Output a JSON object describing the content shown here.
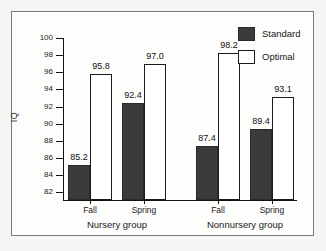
{
  "chart_data": {
    "type": "bar",
    "title": "",
    "xlabel": "",
    "ylabel": "IQ",
    "ylim": [
      81.1,
      100
    ],
    "yticks": [
      82,
      84,
      86,
      88,
      90,
      92,
      94,
      96,
      98,
      100
    ],
    "grid": false,
    "legend_position": "top-right",
    "categories": [
      "Fall",
      "Spring",
      "Fall",
      "Spring"
    ],
    "groups": [
      {
        "name": "Nursery group",
        "categories": [
          "Fall",
          "Spring"
        ]
      },
      {
        "name": "Nonnursery group",
        "categories": [
          "Fall",
          "Spring"
        ]
      }
    ],
    "series": [
      {
        "name": "Standard",
        "color": "#3b3b3b",
        "values": [
          85.2,
          92.4,
          87.4,
          89.4
        ]
      },
      {
        "name": "Optimal",
        "color": "#ffffff",
        "values": [
          95.8,
          97.0,
          98.2,
          93.1
        ]
      }
    ],
    "bars": [
      {
        "label": "85.2",
        "series": "Standard",
        "group": "Nursery group",
        "category": "Fall",
        "value": 85.2,
        "left": 68,
        "width": 22
      },
      {
        "label": "95.8",
        "series": "Optimal",
        "group": "Nursery group",
        "category": "Fall",
        "value": 95.8,
        "left": 90,
        "width": 22
      },
      {
        "label": "92.4",
        "series": "Standard",
        "group": "Nursery group",
        "category": "Spring",
        "value": 92.4,
        "left": 122,
        "width": 22
      },
      {
        "label": "97.0",
        "series": "Optimal",
        "group": "Nursery group",
        "category": "Spring",
        "value": 97.0,
        "left": 144,
        "width": 22
      },
      {
        "label": "87.4",
        "series": "Standard",
        "group": "Nonnursery group",
        "category": "Fall",
        "value": 87.4,
        "left": 196,
        "width": 22
      },
      {
        "label": "98.2",
        "series": "Optimal",
        "group": "Nonnursery group",
        "category": "Fall",
        "value": 98.2,
        "left": 218,
        "width": 22
      },
      {
        "label": "89.4",
        "series": "Standard",
        "group": "Nonnursery group",
        "category": "Spring",
        "value": 89.4,
        "left": 250,
        "width": 22
      },
      {
        "label": "93.1",
        "series": "Optimal",
        "group": "Nonnursery group",
        "category": "Spring",
        "value": 93.1,
        "left": 272,
        "width": 22
      }
    ]
  },
  "axis": {
    "ylabel": "IQ",
    "yticks": [
      "100",
      "98",
      "96",
      "94",
      "92",
      "90",
      "88",
      "86",
      "84",
      "82"
    ]
  },
  "xaxis": {
    "ticks": [
      {
        "label": "Fall",
        "center": 90
      },
      {
        "label": "Spring",
        "center": 144
      },
      {
        "label": "Fall",
        "center": 218
      },
      {
        "label": "Spring",
        "center": 272
      }
    ],
    "groups": [
      {
        "label": "Nursery group",
        "center": 117
      },
      {
        "label": "Nonnursery group",
        "center": 245
      }
    ]
  },
  "legend": {
    "items": [
      {
        "label": "Standard",
        "swatch": "standard"
      },
      {
        "label": "Optimal",
        "swatch": "optimal"
      }
    ]
  },
  "colors": {
    "standard": "#3b3b3b",
    "optimal": "#ffffff",
    "axis": "#111111",
    "frame": "#7a7a7a",
    "background": "#f6f5f3"
  }
}
